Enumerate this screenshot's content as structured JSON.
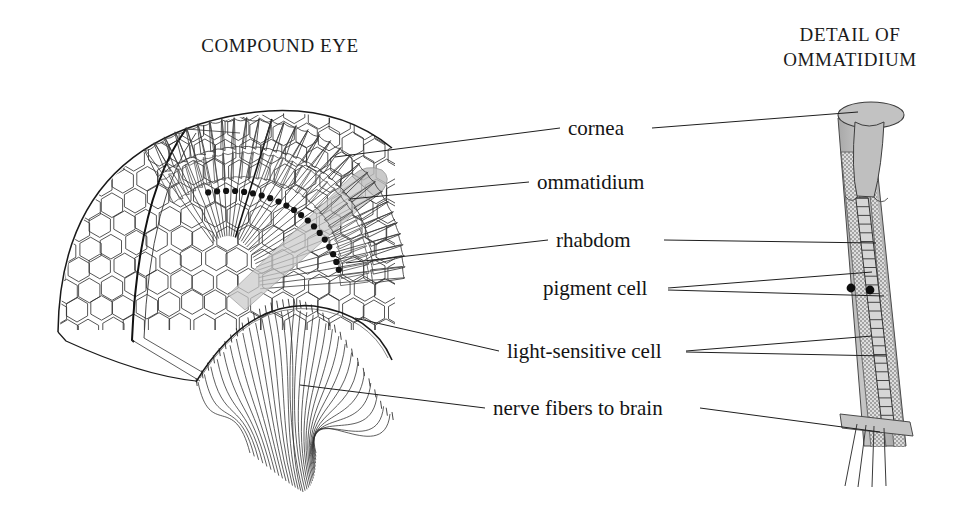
{
  "figure": {
    "kind": "labeled-anatomical-diagram",
    "background_color": "#ffffff",
    "ink_color": "#1a1a1a",
    "highlight_gray": "#b9b9b9",
    "stipple_gray": "#cfcfcf"
  },
  "titles": {
    "left": "COMPOUND EYE",
    "right_line1": "DETAIL OF",
    "right_line2": "OMMATIDIUM"
  },
  "labels": [
    {
      "id": "cornea",
      "text": "cornea",
      "x": 568,
      "y": 116
    },
    {
      "id": "ommatidium",
      "text": "ommatidium",
      "x": 537,
      "y": 170
    },
    {
      "id": "rhabdom",
      "text": "rhabdom",
      "x": 556,
      "y": 228
    },
    {
      "id": "pigment-cell",
      "text": "pigment cell",
      "x": 543,
      "y": 276
    },
    {
      "id": "light-sensitive-cell",
      "text": "light-sensitive cell",
      "x": 507,
      "y": 339
    },
    {
      "id": "nerve-fibers-to-brain",
      "text": "nerve fibers to brain",
      "x": 493,
      "y": 396
    }
  ],
  "leaders": [
    {
      "label": "cornea",
      "side": "left",
      "from": [
        560,
        128
      ],
      "to": [
        335,
        157
      ]
    },
    {
      "label": "cornea",
      "side": "right",
      "from": [
        652,
        128
      ],
      "to": [
        858,
        112
      ]
    },
    {
      "label": "ommatidium",
      "side": "left",
      "from": [
        529,
        182
      ],
      "to": [
        350,
        199
      ]
    },
    {
      "label": "rhabdom",
      "side": "left",
      "from": [
        548,
        240
      ],
      "to": [
        346,
        263
      ]
    },
    {
      "label": "rhabdom",
      "side": "right",
      "from": [
        664,
        240
      ],
      "to": [
        876,
        243
      ]
    },
    {
      "label": "pigment-cell",
      "side": "right-a",
      "from": [
        668,
        288
      ],
      "to": [
        872,
        272
      ]
    },
    {
      "label": "pigment-cell",
      "side": "right-b",
      "from": [
        668,
        290
      ],
      "to": [
        884,
        296
      ]
    },
    {
      "label": "light-sensitive-cell",
      "side": "left",
      "from": [
        499,
        351
      ],
      "to": [
        355,
        318
      ]
    },
    {
      "label": "light-sensitive-cell",
      "side": "right-a",
      "from": [
        686,
        351
      ],
      "to": [
        872,
        336
      ]
    },
    {
      "label": "light-sensitive-cell",
      "side": "right-b",
      "from": [
        686,
        352
      ],
      "to": [
        886,
        356
      ]
    },
    {
      "label": "nerve-fibers-to-brain",
      "side": "left",
      "from": [
        485,
        408
      ],
      "to": [
        300,
        385
      ]
    },
    {
      "label": "nerve-fibers-to-brain",
      "side": "right",
      "from": [
        700,
        408
      ],
      "to": [
        880,
        432
      ]
    }
  ],
  "compound_eye": {
    "facet_surface": "hexagonal facet array on the curved anterior dome",
    "cutaway": "radial fan of ommatidia sectioned open",
    "highlighted_ommatidium": "one ommatidium shaded gray",
    "pigment_dot_count": 20,
    "ommatidia_count": 30,
    "nerve_bundle": "fibers converging below the basement membrane"
  },
  "ommatidium_detail": {
    "parts": [
      "cornea cap",
      "crystalline cone",
      "pigment cell columns",
      "rhabdom ladder",
      "light-sensitive cells",
      "basement membrane",
      "nerve fibers"
    ],
    "pigment_dots": 2,
    "rhabdom_rungs": 26
  }
}
